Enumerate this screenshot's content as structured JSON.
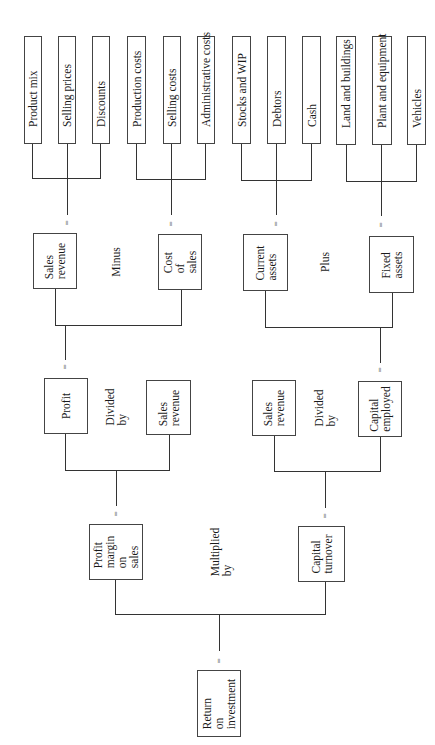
{
  "diagram": {
    "root": {
      "label": "Return\non\ninvestment"
    },
    "level1": {
      "left": {
        "label": "Profit\nmargin\non\nsales"
      },
      "operator": "Multiplied\nby",
      "right": {
        "label": "Capital\nturnover"
      }
    },
    "level2": {
      "left_group": {
        "a": {
          "label": "Profit"
        },
        "operator": "Divided\nby",
        "b": {
          "label": "Sales\nrevenue"
        }
      },
      "right_group": {
        "a": {
          "label": "Sales\nrevenue"
        },
        "operator": "Divided\nby",
        "b": {
          "label": "Capital\nemployed"
        }
      }
    },
    "level3": {
      "left_group": {
        "a": {
          "label": "Sales\nrevenue"
        },
        "operator": "Minus",
        "b": {
          "label": "Cost\nof\nsales"
        }
      },
      "right_group": {
        "a": {
          "label": "Current\nassets"
        },
        "operator": "Plus",
        "b": {
          "label": "Fixed\nassets"
        }
      }
    },
    "leaves": {
      "sales_revenue": [
        "Product mix",
        "Selling prices",
        "Discounts"
      ],
      "cost_of_sales": [
        "Production costs",
        "Selling costs",
        "Administrative costs"
      ],
      "current_assets": [
        "Stocks and WIP",
        "Debtors",
        "Cash"
      ],
      "fixed_assets": [
        "Land and buildings",
        "Plant and equipment",
        "Vehicles"
      ]
    },
    "equals_symbol": "="
  }
}
